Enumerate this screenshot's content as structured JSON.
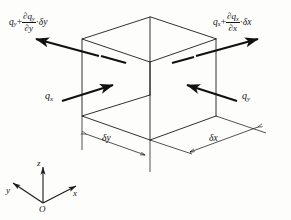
{
  "figure": {
    "type": "engineering-diagram",
    "background_color": "#fdfdfc",
    "line_color": "#1a1a1a",
    "arrow_color": "#111111"
  },
  "labels": {
    "flux_out_y": {
      "name": "flux-out-y",
      "q": "q",
      "q_sub": "y",
      "plus": "+",
      "numerator_d": "∂",
      "numerator_q": "q",
      "numerator_q_sub": "y",
      "denominator_d": "∂",
      "denominator_var": "y",
      "dot": "·",
      "delta": "δ",
      "delta_var": "y",
      "full_text": "q_y + (∂q_y/∂y)·δy"
    },
    "flux_out_x": {
      "name": "flux-out-x",
      "q": "q",
      "q_sub": "x",
      "plus": "+",
      "numerator_d": "∂",
      "numerator_q": "q",
      "numerator_q_sub": "x",
      "denominator_d": "∂",
      "denominator_var": "x",
      "dot": "·",
      "delta": "δ",
      "delta_var": "x",
      "full_text": "q_x + (∂q_x/∂x)·δx"
    },
    "flux_in_x": {
      "name": "flux-in-x",
      "q": "q",
      "q_sub": "x",
      "full_text": "q_x"
    },
    "flux_in_y": {
      "name": "flux-in-y",
      "q": "q",
      "q_sub": "y",
      "full_text": "q_y"
    },
    "dim_dy": {
      "name": "dimension-delta-y",
      "delta": "δ",
      "var": "y",
      "full_text": "δy"
    },
    "dim_dx": {
      "name": "dimension-delta-x",
      "delta": "δ",
      "var": "x",
      "full_text": "δx"
    }
  },
  "axes": {
    "z": "z",
    "y": "y",
    "x": "x",
    "origin": "O"
  }
}
